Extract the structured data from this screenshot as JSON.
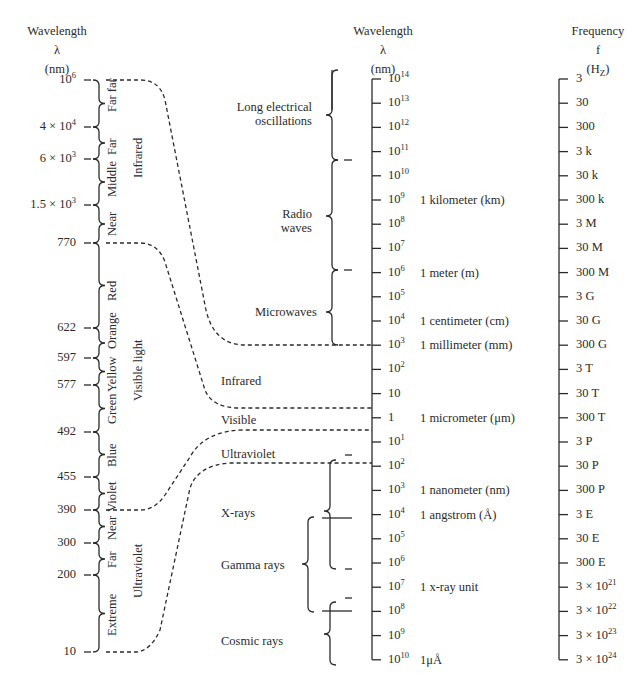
{
  "headers": {
    "left": {
      "line1": "Wavelength",
      "line2": "λ",
      "line3": "(nm)"
    },
    "middle": {
      "line1": "Wavelength",
      "line2": "λ",
      "line3": "(nm)"
    },
    "right": {
      "line1": "Frequency",
      "line2": "f",
      "line3": "(H",
      "line3_sub": "Z",
      "line3_end": ")"
    }
  },
  "left_axis": {
    "ticks": [
      {
        "base": "10",
        "exp": "6",
        "y": 80
      },
      {
        "base": "4 × 10",
        "exp": "4",
        "y": 127
      },
      {
        "base": "6 × 10",
        "exp": "3",
        "y": 159
      },
      {
        "base": "1.5 × 10",
        "exp": "3",
        "y": 205
      },
      {
        "base": "770",
        "exp": "",
        "y": 243
      },
      {
        "base": "622",
        "exp": "",
        "y": 328
      },
      {
        "base": "597",
        "exp": "",
        "y": 358
      },
      {
        "base": "577",
        "exp": "",
        "y": 385
      },
      {
        "base": "492",
        "exp": "",
        "y": 432
      },
      {
        "base": "455",
        "exp": "",
        "y": 477
      },
      {
        "base": "390",
        "exp": "",
        "y": 510
      },
      {
        "base": "300",
        "exp": "",
        "y": 543
      },
      {
        "base": "200",
        "exp": "",
        "y": 575
      },
      {
        "base": "10",
        "exp": "",
        "y": 652
      }
    ],
    "sub_bands": [
      "Far far",
      "Far",
      "Middle",
      "Near",
      "Red",
      "Orange",
      "Yellow",
      "Green",
      "Blue",
      "Violet",
      "Near",
      "Far",
      "Extreme"
    ],
    "groups": [
      "Infrared",
      "Visible light",
      "Ultraviolet"
    ]
  },
  "middle_axis": {
    "ticks": [
      "10^14",
      "10^13",
      "10^12",
      "10^11",
      "10^10",
      "10^9",
      "10^8",
      "10^7",
      "10^6",
      "10^5",
      "10^4",
      "10^3",
      "10^2",
      "10",
      "1",
      "10^1",
      "10^2",
      "10^3",
      "10^4",
      "10^5",
      "10^6",
      "10^7",
      "10^8",
      "10^9",
      "10^10"
    ],
    "tick_labels": [
      {
        "base": "10",
        "exp": "14"
      },
      {
        "base": "10",
        "exp": "13"
      },
      {
        "base": "10",
        "exp": "12"
      },
      {
        "base": "10",
        "exp": "11"
      },
      {
        "base": "10",
        "exp": "10"
      },
      {
        "base": "10",
        "exp": "9"
      },
      {
        "base": "10",
        "exp": "8"
      },
      {
        "base": "10",
        "exp": "7"
      },
      {
        "base": "10",
        "exp": "6"
      },
      {
        "base": "10",
        "exp": "5"
      },
      {
        "base": "10",
        "exp": "4"
      },
      {
        "base": "10",
        "exp": "3"
      },
      {
        "base": "10",
        "exp": "2"
      },
      {
        "base": "10",
        "exp": ""
      },
      {
        "base": "1",
        "exp": ""
      },
      {
        "base": "10",
        "exp": "1"
      },
      {
        "base": "10",
        "exp": "2"
      },
      {
        "base": "10",
        "exp": "3"
      },
      {
        "base": "10",
        "exp": "4"
      },
      {
        "base": "10",
        "exp": "5"
      },
      {
        "base": "10",
        "exp": "6"
      },
      {
        "base": "10",
        "exp": "7"
      },
      {
        "base": "10",
        "exp": "8"
      },
      {
        "base": "10",
        "exp": "9"
      },
      {
        "base": "10",
        "exp": "10"
      }
    ],
    "units": [
      {
        "label": "1 kilometer (km)",
        "tick_index": 5
      },
      {
        "label": "1 meter (m)",
        "tick_index": 8
      },
      {
        "label": "1 centimeter (cm)",
        "tick_index": 10
      },
      {
        "label": "1 millimeter (mm)",
        "tick_index": 11
      },
      {
        "label": "1 micrometer (μm)",
        "tick_index": 14
      },
      {
        "label": "1 nanometer (nm)",
        "tick_index": 17
      },
      {
        "label": "1 angstrom (Å)",
        "tick_index": 18
      },
      {
        "label": "1 x-ray unit",
        "tick_index": 21
      },
      {
        "label": "1μÅ",
        "tick_index": 24
      }
    ]
  },
  "regions": {
    "long_electrical": [
      "Long electrical",
      "oscillations"
    ],
    "radio": [
      "Radio",
      "waves"
    ],
    "microwaves": "Microwaves",
    "infrared": "Infrared",
    "visible": "Visible",
    "ultraviolet": "Ultraviolet",
    "xrays": "X-rays",
    "gamma": "Gamma rays",
    "cosmic": "Cosmic rays"
  },
  "right_axis": {
    "ticks": [
      "3",
      "30",
      "300",
      "3 k",
      "30 k",
      "300 k",
      "3 M",
      "30 M",
      "300 M",
      "3 G",
      "30 G",
      "300 G",
      "3 T",
      "30 T",
      "300 T",
      "3 P",
      "30 P",
      "300 P",
      "3 E",
      "30 E",
      "300 E",
      "3 × 10^21",
      "3 × 10^22",
      "3 × 10^23",
      "3 × 10^24"
    ],
    "tick_labels": [
      {
        "base": "3",
        "exp": ""
      },
      {
        "base": "30",
        "exp": ""
      },
      {
        "base": "300",
        "exp": ""
      },
      {
        "base": "3 k",
        "exp": ""
      },
      {
        "base": "30 k",
        "exp": ""
      },
      {
        "base": "300 k",
        "exp": ""
      },
      {
        "base": "3 M",
        "exp": ""
      },
      {
        "base": "30 M",
        "exp": ""
      },
      {
        "base": "300 M",
        "exp": ""
      },
      {
        "base": "3 G",
        "exp": ""
      },
      {
        "base": "30 G",
        "exp": ""
      },
      {
        "base": "300 G",
        "exp": ""
      },
      {
        "base": "3 T",
        "exp": ""
      },
      {
        "base": "30 T",
        "exp": ""
      },
      {
        "base": "300 T",
        "exp": ""
      },
      {
        "base": "3 P",
        "exp": ""
      },
      {
        "base": "30 P",
        "exp": ""
      },
      {
        "base": "300 P",
        "exp": ""
      },
      {
        "base": "3 E",
        "exp": ""
      },
      {
        "base": "30 E",
        "exp": ""
      },
      {
        "base": "300 E",
        "exp": ""
      },
      {
        "base": "3 × 10",
        "exp": "21"
      },
      {
        "base": "3 × 10",
        "exp": "22"
      },
      {
        "base": "3 × 10",
        "exp": "23"
      },
      {
        "base": "3 × 10",
        "exp": "24"
      }
    ]
  },
  "colors": {
    "ink": "#2b2b2b",
    "background": "#ffffff"
  }
}
